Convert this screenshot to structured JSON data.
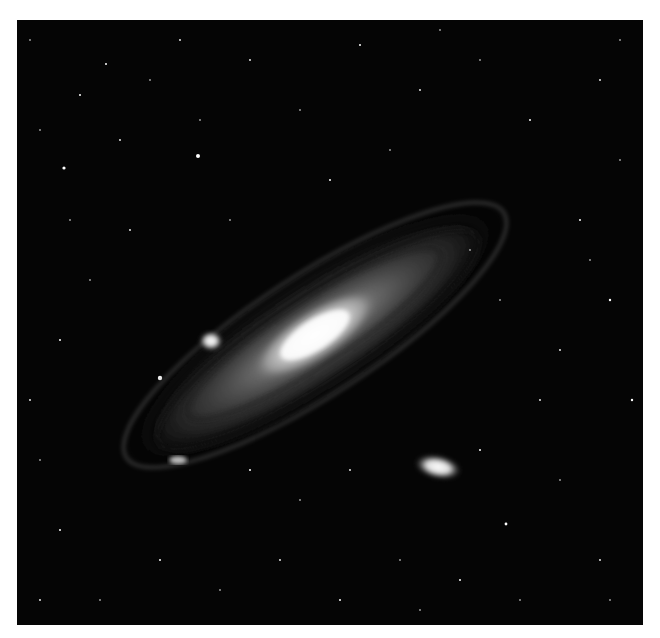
{
  "image": {
    "subject": "Andromeda Galaxy",
    "description": "Black-and-white photograph of a large spiral galaxy seen at an oblique angle, with two satellite galaxies and a dense star field",
    "background_color": "#ffffff",
    "photo_background": "#050505",
    "features": [
      {
        "name": "galaxy-core",
        "cx": 315,
        "cy": 335
      },
      {
        "name": "satellite-galaxy-upper-left",
        "cx": 211,
        "cy": 341
      },
      {
        "name": "satellite-galaxy-lower-right",
        "cx": 438,
        "cy": 467
      },
      {
        "name": "bright-star",
        "cx": 160,
        "cy": 378
      }
    ]
  }
}
